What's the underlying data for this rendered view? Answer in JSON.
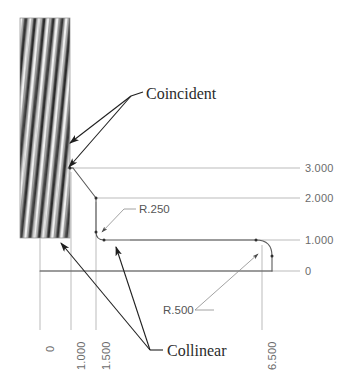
{
  "drawing": {
    "title": "Sketch relations diagram",
    "colors": {
      "background": "#ffffff",
      "profile_line": "#8d8d8d",
      "extension_line": "#a9a9a9",
      "leader_line": "#2b2b2b",
      "dim_text": "#6b6b6b",
      "note_text": "#2b2b2b",
      "hatch_dark": "#3a3a3a",
      "hatch_light": "#e8e8e8"
    },
    "hatch_block": {
      "name": "fixed-wall-hatch",
      "x": 20,
      "y": 18,
      "width": 50,
      "height": 220
    },
    "vertical_dimensions": [
      {
        "label": "3.000",
        "value": 3.0,
        "x": 305,
        "y": 162
      },
      {
        "label": "2.000",
        "value": 2.0,
        "x": 305,
        "y": 192
      },
      {
        "label": "1.000",
        "value": 1.0,
        "x": 305,
        "y": 234
      },
      {
        "label": "0",
        "value": 0.0,
        "x": 305,
        "y": 266
      }
    ],
    "horizontal_dimensions": [
      {
        "label": "0",
        "value": 0.0,
        "x": 44,
        "y": 350
      },
      {
        "label": "1.000",
        "value": 1.0,
        "x": 75,
        "y": 350
      },
      {
        "label": "1.500",
        "value": 1.5,
        "x": 100,
        "y": 350
      },
      {
        "label": "6.500",
        "value": 6.5,
        "x": 266,
        "y": 350
      }
    ],
    "radius_callouts": [
      {
        "label": "R.250",
        "value": 0.25,
        "x": 139,
        "y": 205
      },
      {
        "label": "R.500",
        "value": 0.5,
        "x": 163,
        "y": 312
      }
    ],
    "relation_notes": [
      {
        "label": "Coincident",
        "x": 146,
        "y": 86,
        "arrow_count": 2
      },
      {
        "label": "Collinear",
        "x": 167,
        "y": 345,
        "arrow_count": 2
      }
    ]
  }
}
